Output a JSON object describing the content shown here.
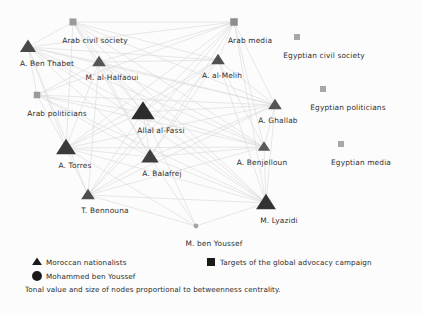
{
  "figure": {
    "caption": "Tonal value and size of nodes proportional to betweenness centrality.",
    "background_color": "#fcfcfc",
    "edge_color": "#d9d9d9"
  },
  "legend": {
    "items": [
      {
        "glyph": "triangle-icon",
        "label": "Moroccan nationalists",
        "color": "#1a1a1a",
        "x": 37,
        "y": 262
      },
      {
        "glyph": "circle-icon",
        "label": "Mohammed ben Youssef",
        "color": "#1a1a1a",
        "x": 37,
        "y": 276
      },
      {
        "glyph": "square-icon",
        "label": "Targets of the global advocacy campaign",
        "color": "#1a1a1a",
        "x": 211,
        "y": 262
      }
    ]
  },
  "chart_data": {
    "type": "network",
    "title": "",
    "xlabel": "",
    "ylabel": "",
    "node_shapes": {
      "triangle": "Moroccan nationalists",
      "circle": "Mohammed ben Youssef",
      "square": "Targets of the global advocacy campaign"
    },
    "nodes": [
      {
        "id": "arab_civil_society",
        "label": "Arab civil society",
        "shape": "square",
        "x": 73,
        "y": 22,
        "size": 7,
        "color": "#9a9a9a",
        "label_dx": 22,
        "label_dy": 14
      },
      {
        "id": "arab_media",
        "label": "Arab media",
        "shape": "square",
        "x": 234,
        "y": 22,
        "size": 7.5,
        "color": "#8d8d8d",
        "label_dx": 16,
        "label_dy": 14
      },
      {
        "id": "egyptian_civil_society",
        "label": "Egyptian civil society",
        "shape": "square",
        "x": 297,
        "y": 37,
        "size": 6,
        "color": "#a8a8a8",
        "label_dx": 27,
        "label_dy": 14
      },
      {
        "id": "egyptian_politicians",
        "label": "Egyptian politicians",
        "shape": "square",
        "x": 323,
        "y": 89,
        "size": 6,
        "color": "#a8a8a8",
        "label_dx": 25,
        "label_dy": 14
      },
      {
        "id": "egyptian_media",
        "label": "Egyptian media",
        "shape": "square",
        "x": 341,
        "y": 144,
        "size": 6,
        "color": "#a8a8a8",
        "label_dx": 20,
        "label_dy": 14
      },
      {
        "id": "arab_politicians",
        "label": "Arab politicians",
        "shape": "square",
        "x": 37,
        "y": 95,
        "size": 6.5,
        "color": "#9a9a9a",
        "label_dx": 20,
        "label_dy": 14
      },
      {
        "id": "ben_thabet",
        "label": "A. Ben Thabet",
        "shape": "triangle",
        "x": 28,
        "y": 47,
        "size": 13,
        "color": "#4a4a4a",
        "label_dx": 19,
        "label_dy": 12
      },
      {
        "id": "al_halfaoui",
        "label": "M. al-Halfaoui",
        "shape": "triangle",
        "x": 99,
        "y": 62,
        "size": 11,
        "color": "#555555",
        "label_dx": 13,
        "label_dy": 11
      },
      {
        "id": "al_melih",
        "label": "A. al-Melih",
        "shape": "triangle",
        "x": 218,
        "y": 60,
        "size": 11,
        "color": "#4f4f4f",
        "label_dx": 4,
        "label_dy": 11
      },
      {
        "id": "ghallab",
        "label": "A. Ghallab",
        "shape": "triangle",
        "x": 275,
        "y": 105,
        "size": 11,
        "color": "#555555",
        "label_dx": 3,
        "label_dy": 11
      },
      {
        "id": "allal_al_fassi",
        "label": "Allal al-Fassi",
        "shape": "triangle",
        "x": 143,
        "y": 112,
        "size": 19,
        "color": "#2c2c2c",
        "label_dx": 18,
        "label_dy": 14
      },
      {
        "id": "torres",
        "label": "A. Torres",
        "shape": "triangle",
        "x": 66,
        "y": 148,
        "size": 16,
        "color": "#3a3a3a",
        "label_dx": 9,
        "label_dy": 13
      },
      {
        "id": "benjelloun",
        "label": "A. Benjelloun",
        "shape": "triangle",
        "x": 264,
        "y": 147,
        "size": 10,
        "color": "#5a5a5a",
        "label_dx": -2,
        "label_dy": 11
      },
      {
        "id": "balafrej",
        "label": "A. Balafrej",
        "shape": "triangle",
        "x": 150,
        "y": 157,
        "size": 14,
        "color": "#3e3e3e",
        "label_dx": 12,
        "label_dy": 12
      },
      {
        "id": "bennouna",
        "label": "T. Bennouna",
        "shape": "triangle",
        "x": 88,
        "y": 195,
        "size": 11,
        "color": "#4e4e4e",
        "label_dx": 17,
        "label_dy": 11
      },
      {
        "id": "lyazidi",
        "label": "M. Lyazidi",
        "shape": "triangle",
        "x": 266,
        "y": 203,
        "size": 16,
        "color": "#333333",
        "label_dx": 13,
        "label_dy": 13
      },
      {
        "id": "ben_youssef",
        "label": "M. ben Youssef",
        "shape": "circle",
        "x": 196,
        "y": 226,
        "size": 4,
        "color": "#a5a5a5",
        "label_dx": 18,
        "label_dy": 13
      }
    ],
    "edges": [
      [
        "arab_civil_society",
        "ben_thabet"
      ],
      [
        "arab_civil_society",
        "al_halfaoui"
      ],
      [
        "arab_civil_society",
        "allal_al_fassi"
      ],
      [
        "arab_civil_society",
        "torres"
      ],
      [
        "arab_civil_society",
        "balafrej"
      ],
      [
        "arab_civil_society",
        "al_melih"
      ],
      [
        "arab_civil_society",
        "ghallab"
      ],
      [
        "arab_civil_society",
        "lyazidi"
      ],
      [
        "arab_civil_society",
        "benjelloun"
      ],
      [
        "arab_media",
        "ben_thabet"
      ],
      [
        "arab_media",
        "al_halfaoui"
      ],
      [
        "arab_media",
        "allal_al_fassi"
      ],
      [
        "arab_media",
        "torres"
      ],
      [
        "arab_media",
        "balafrej"
      ],
      [
        "arab_media",
        "al_melih"
      ],
      [
        "arab_media",
        "ghallab"
      ],
      [
        "arab_media",
        "lyazidi"
      ],
      [
        "arab_media",
        "benjelloun"
      ],
      [
        "arab_media",
        "arab_politicians"
      ],
      [
        "arab_media",
        "bennouna"
      ],
      [
        "arab_media",
        "arab_civil_society"
      ],
      [
        "arab_politicians",
        "ben_thabet"
      ],
      [
        "arab_politicians",
        "al_halfaoui"
      ],
      [
        "arab_politicians",
        "allal_al_fassi"
      ],
      [
        "arab_politicians",
        "torres"
      ],
      [
        "arab_politicians",
        "balafrej"
      ],
      [
        "arab_politicians",
        "lyazidi"
      ],
      [
        "arab_politicians",
        "ghallab"
      ],
      [
        "arab_politicians",
        "benjelloun"
      ],
      [
        "ben_thabet",
        "al_halfaoui"
      ],
      [
        "ben_thabet",
        "allal_al_fassi"
      ],
      [
        "ben_thabet",
        "torres"
      ],
      [
        "ben_thabet",
        "balafrej"
      ],
      [
        "ben_thabet",
        "al_melih"
      ],
      [
        "ben_thabet",
        "ghallab"
      ],
      [
        "ben_thabet",
        "lyazidi"
      ],
      [
        "ben_thabet",
        "benjelloun"
      ],
      [
        "ben_thabet",
        "bennouna"
      ],
      [
        "al_halfaoui",
        "allal_al_fassi"
      ],
      [
        "al_halfaoui",
        "torres"
      ],
      [
        "al_halfaoui",
        "balafrej"
      ],
      [
        "al_halfaoui",
        "al_melih"
      ],
      [
        "al_halfaoui",
        "ghallab"
      ],
      [
        "al_halfaoui",
        "lyazidi"
      ],
      [
        "al_halfaoui",
        "benjelloun"
      ],
      [
        "al_halfaoui",
        "bennouna"
      ],
      [
        "al_melih",
        "allal_al_fassi"
      ],
      [
        "al_melih",
        "torres"
      ],
      [
        "al_melih",
        "balafrej"
      ],
      [
        "al_melih",
        "ghallab"
      ],
      [
        "al_melih",
        "lyazidi"
      ],
      [
        "al_melih",
        "benjelloun"
      ],
      [
        "al_melih",
        "bennouna"
      ],
      [
        "allal_al_fassi",
        "torres"
      ],
      [
        "allal_al_fassi",
        "balafrej"
      ],
      [
        "allal_al_fassi",
        "ghallab"
      ],
      [
        "allal_al_fassi",
        "lyazidi"
      ],
      [
        "allal_al_fassi",
        "benjelloun"
      ],
      [
        "allal_al_fassi",
        "bennouna"
      ],
      [
        "allal_al_fassi",
        "ben_youssef"
      ],
      [
        "torres",
        "balafrej"
      ],
      [
        "torres",
        "ghallab"
      ],
      [
        "torres",
        "lyazidi"
      ],
      [
        "torres",
        "benjelloun"
      ],
      [
        "torres",
        "bennouna"
      ],
      [
        "torres",
        "ben_youssef"
      ],
      [
        "balafrej",
        "ghallab"
      ],
      [
        "balafrej",
        "lyazidi"
      ],
      [
        "balafrej",
        "benjelloun"
      ],
      [
        "balafrej",
        "bennouna"
      ],
      [
        "balafrej",
        "ben_youssef"
      ],
      [
        "ghallab",
        "lyazidi"
      ],
      [
        "ghallab",
        "benjelloun"
      ],
      [
        "ghallab",
        "bennouna"
      ],
      [
        "benjelloun",
        "lyazidi"
      ],
      [
        "benjelloun",
        "bennouna"
      ],
      [
        "bennouna",
        "lyazidi"
      ],
      [
        "bennouna",
        "ben_youssef"
      ],
      [
        "lyazidi",
        "ben_youssef"
      ]
    ]
  }
}
